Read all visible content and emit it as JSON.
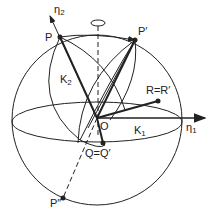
{
  "diagram": {
    "labels": {
      "eta2": "η",
      "eta2_sub": "2",
      "eta1": "η",
      "eta1_sub": "1",
      "P": "P",
      "P_prime": "P′",
      "P_double_prime": "P″",
      "K2": "K",
      "K2_sub": "2",
      "K1": "K",
      "K1_sub": "1",
      "O": "O",
      "R": "R=R′",
      "Q": "Q=Q′"
    },
    "colors": {
      "stroke": "#222222",
      "background": "#ffffff"
    }
  }
}
